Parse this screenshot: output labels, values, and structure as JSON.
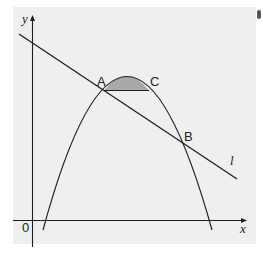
{
  "diagram": {
    "type": "coordinate-graph",
    "background_color": "#efefef",
    "shade_color": "#a9a9a9",
    "stroke_color": "#1e1e1e",
    "axes": {
      "x_label": "x",
      "y_label": "y",
      "origin_label": "0"
    },
    "curve": {
      "kind": "downward parabola",
      "description": "Parabola crossing x-axis at two points with maximum between A and C"
    },
    "line": {
      "label": "l",
      "description": "Straight line with negative gradient intersecting parabola at A and B"
    },
    "points": [
      {
        "label": "A",
        "description": "intersection of line l and parabola (left)"
      },
      {
        "label": "B",
        "description": "intersection of line l and parabola (right)"
      },
      {
        "label": "C",
        "description": "point on parabola at same height as A"
      }
    ],
    "shaded_region": "Region bounded by the parabola and the horizontal chord AC"
  }
}
